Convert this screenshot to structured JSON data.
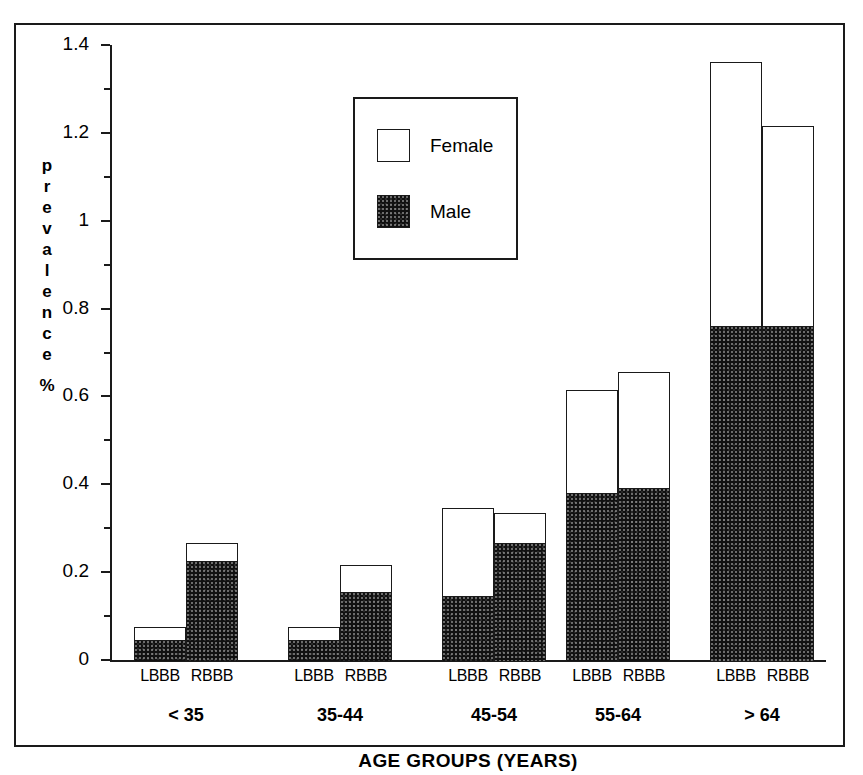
{
  "chart_data": {
    "type": "bar",
    "subtype": "stacked-grouped",
    "title": "",
    "xlabel": "AGE GROUPS (YEARS)",
    "ylabel": "prevalence %",
    "ylim": [
      0,
      1.4
    ],
    "ytick_labels": [
      "0",
      "0.2",
      "0.4",
      "0.6",
      "0.8",
      "1",
      "1.2",
      "1.4"
    ],
    "ytick_values": [
      0,
      0.2,
      0.4,
      0.6,
      0.8,
      1,
      1.2,
      1.4
    ],
    "minor_ticks_per_interval": 1,
    "grid": false,
    "legend_position": "upper-left-inside",
    "categories": [
      "< 35",
      "35-44",
      "45-54",
      "55-64",
      "> 64"
    ],
    "subcategories": [
      "LBBB",
      "RBBB"
    ],
    "series": [
      {
        "name": "Male",
        "color": "#111111",
        "values": {
          "LBBB": [
            0.05,
            0.05,
            0.15,
            0.385,
            0.765
          ],
          "RBBB": [
            0.23,
            0.16,
            0.27,
            0.395,
            0.765
          ]
        }
      },
      {
        "name": "Female",
        "color": "#ffffff",
        "values": {
          "LBBB": [
            0.03,
            0.03,
            0.2,
            0.235,
            0.6
          ],
          "RBBB": [
            0.04,
            0.06,
            0.07,
            0.265,
            0.455
          ]
        }
      }
    ],
    "totals": {
      "LBBB": [
        0.08,
        0.08,
        0.35,
        0.62,
        1.365
      ],
      "RBBB": [
        0.27,
        0.22,
        0.34,
        0.66,
        1.22
      ]
    }
  },
  "axis": {
    "ylabel_chars": [
      "p",
      "r",
      "e",
      "v",
      "a",
      "l",
      "e",
      "n",
      "c",
      "e"
    ],
    "ylabel_unit": "%",
    "xlabel": "AGE GROUPS (YEARS)"
  },
  "legend": {
    "items": [
      {
        "label": "Female",
        "swatch": "female-swatch"
      },
      {
        "label": "Male",
        "swatch": "male-swatch"
      }
    ]
  }
}
